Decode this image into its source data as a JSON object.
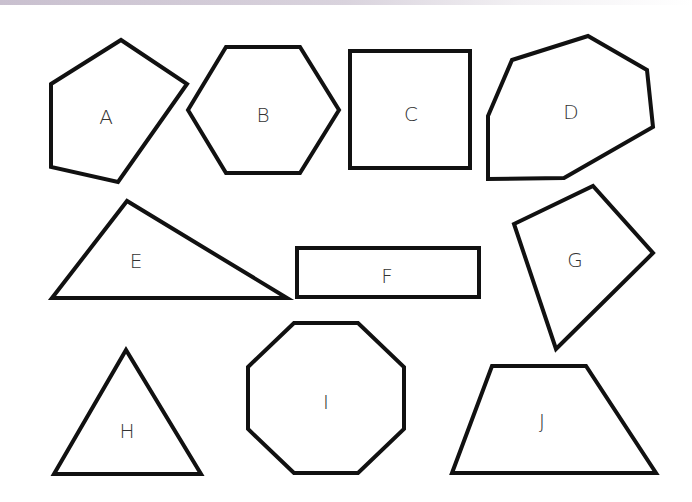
{
  "figure": {
    "stroke_color": "#111111",
    "label_color": "#333333",
    "background": "#ffffff",
    "shapes": [
      {
        "label": "A",
        "type": "pentagon",
        "points": "51,84 121,40 187,84 118,182 51,167",
        "label_pos": [
          106,
          118
        ]
      },
      {
        "label": "B",
        "type": "hexagon",
        "points": "188,110 226,47 300,47 339,110 300,173 226,173",
        "label_pos": [
          263,
          116
        ]
      },
      {
        "label": "C",
        "type": "square",
        "points": "350,51 470,51 470,168 350,168",
        "label_pos": [
          411,
          115
        ]
      },
      {
        "label": "D",
        "type": "heptagon",
        "points": "488,116 512,60 588,36 647,70 653,127 564,178 488,179",
        "label_pos": [
          571,
          113
        ]
      },
      {
        "label": "E",
        "type": "triangle",
        "points": "52,298 127,201 287,298",
        "label_pos": [
          136,
          262
        ]
      },
      {
        "label": "F",
        "type": "rectangle",
        "points": "297,248 479,248 479,297 297,297",
        "label_pos": [
          387,
          277
        ]
      },
      {
        "label": "G",
        "type": "quadrilateral",
        "points": "514,224 593,186 653,253 556,349",
        "label_pos": [
          575,
          261
        ]
      },
      {
        "label": "H",
        "type": "triangle",
        "points": "54,474 126,350 201,474",
        "label_pos": [
          127,
          432
        ]
      },
      {
        "label": "I",
        "type": "octagon",
        "points": "248,367 294,323 358,323 404,367 404,429 358,473 294,473 248,429",
        "label_pos": [
          326,
          403
        ]
      },
      {
        "label": "J",
        "type": "trapezoid",
        "points": "452,473 492,366 586,366 656,473",
        "label_pos": [
          542,
          422
        ]
      }
    ]
  }
}
